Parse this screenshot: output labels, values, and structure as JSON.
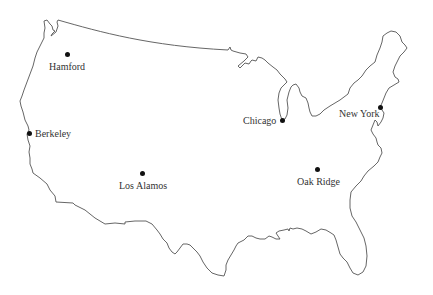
{
  "map": {
    "region": "Contiguous United States",
    "outline_color": "#555555",
    "marker_color": "#111111",
    "label_color": "#333333",
    "sites": [
      {
        "id": "hamford",
        "label": "Hamford",
        "x": 67,
        "y": 54
      },
      {
        "id": "berkeley",
        "label": "Berkeley",
        "x": 29,
        "y": 133
      },
      {
        "id": "los-alamos",
        "label": "Los Alamos",
        "x": 142,
        "y": 173
      },
      {
        "id": "chicago",
        "label": "Chicago",
        "x": 282,
        "y": 120
      },
      {
        "id": "new-york",
        "label": "New York",
        "x": 380,
        "y": 107
      },
      {
        "id": "oak-ridge",
        "label": "Oak Ridge",
        "x": 317,
        "y": 169
      }
    ]
  }
}
